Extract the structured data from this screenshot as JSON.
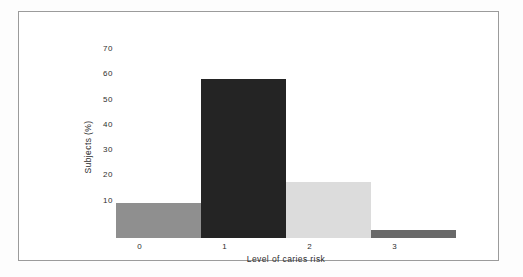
{
  "figure": {
    "frame_border_color": "#9b9b9b",
    "background_color": "#ffffff",
    "text_color": "#2e2e2e"
  },
  "chart_data": {
    "type": "bar",
    "categories": [
      "0",
      "1",
      "2",
      "3"
    ],
    "values": [
      14,
      63,
      22,
      3
    ],
    "xlabel": "Level of caries risk",
    "ylabel": "Subjects (%)",
    "ylim": [
      0,
      70
    ],
    "yticks": [
      10,
      20,
      30,
      40,
      50,
      60,
      70
    ],
    "grid": false,
    "legend": "none",
    "bar_gap": 0,
    "bar_colors": [
      "#8f8f8f",
      "#242424",
      "#dcdcdc",
      "#696969"
    ]
  }
}
